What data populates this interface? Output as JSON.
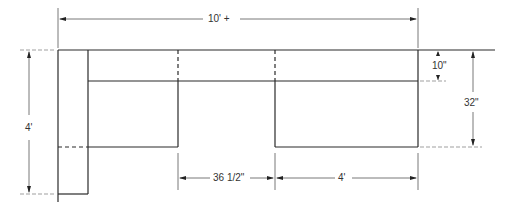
{
  "drawing": {
    "type": "plan-view-sectional-sofa",
    "dimensions": {
      "overall_width": "10' +",
      "left_depth": "4'",
      "back_depth": "10\"",
      "seat_depth": "32\"",
      "gap_width": "36 1/2\"",
      "right_section_width": "4'"
    },
    "colors": {
      "line": "#2a2a2a",
      "background": "#ffffff"
    }
  }
}
